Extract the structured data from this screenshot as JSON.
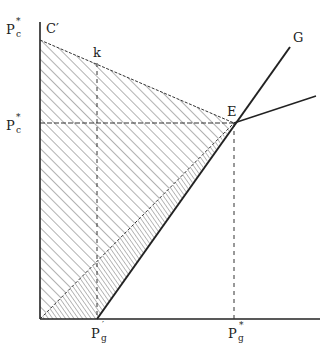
{
  "diagram": {
    "type": "economic-price-diagram",
    "axes": {
      "origin": [
        40,
        319
      ],
      "y_axis_top": [
        40,
        22
      ],
      "x_axis_end": [
        320,
        319
      ]
    },
    "points": {
      "C_prime": {
        "label": "C′",
        "xy": [
          39,
          40
        ],
        "label_xy": [
          46,
          33
        ]
      },
      "k": {
        "label": "k",
        "xy": [
          97,
          63
        ],
        "label_xy": [
          94,
          57
        ]
      },
      "E": {
        "label": "E",
        "xy": [
          234,
          123
        ],
        "label_xy": [
          227,
          115
        ]
      },
      "G": {
        "label": "G",
        "xy": [
          290,
          47
        ],
        "label_xy": [
          294,
          42
        ]
      },
      "P_g_prime_foot": [
        97,
        319
      ],
      "P_g_star_foot": [
        234,
        319
      ],
      "right_line_end": [
        316,
        96
      ]
    },
    "y_labels": [
      {
        "id": "pc-star-top",
        "main": "P",
        "sub": "c",
        "sup": "*",
        "xy": [
          6,
          34
        ]
      },
      {
        "id": "pc-star-mid",
        "main": "P",
        "sub": "c",
        "sup": "*",
        "xy": [
          6,
          129
        ]
      }
    ],
    "x_labels": [
      {
        "id": "pg-prime",
        "main": "P",
        "sub": "g",
        "sup": "′",
        "xy": [
          92,
          337
        ]
      },
      {
        "id": "pg-star",
        "main": "P",
        "sub": "g",
        "sup": "*",
        "xy": [
          229,
          337
        ]
      }
    ],
    "colors": {
      "ink": "#222222",
      "hatch": "#555555",
      "background": "#ffffff"
    }
  }
}
